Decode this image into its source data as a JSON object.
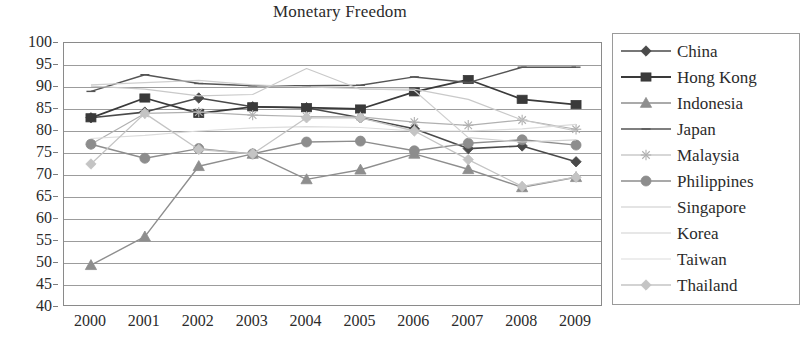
{
  "chart_data": {
    "type": "line",
    "title": "Monetary Freedom",
    "xlabel": "",
    "ylabel": "",
    "grid": true,
    "legend_position": "right",
    "ylim": [
      40,
      100
    ],
    "ytick_step": 5,
    "yticks": [
      100,
      95,
      90,
      85,
      80,
      75,
      70,
      65,
      60,
      55,
      50,
      45,
      40
    ],
    "categories": [
      "2000",
      "2001",
      "2002",
      "2003",
      "2004",
      "2005",
      "2006",
      "2007",
      "2008",
      "2009"
    ],
    "x": [
      2000,
      2001,
      2002,
      2003,
      2004,
      2005,
      2006,
      2007,
      2008,
      2009
    ],
    "series": [
      {
        "name": "China",
        "marker": "diamond",
        "color": "#4a4a4a",
        "line_width": 1.6,
        "values": [
          83.0,
          84.3,
          87.5,
          85.5,
          85.3,
          83.0,
          80.5,
          76.0,
          76.6,
          73.0
        ]
      },
      {
        "name": "Hong Kong",
        "marker": "square",
        "color": "#3a3a3a",
        "line_width": 1.8,
        "values": [
          83.0,
          87.5,
          84.0,
          85.5,
          85.3,
          85.0,
          88.9,
          91.7,
          87.2,
          86.0
        ]
      },
      {
        "name": "Indonesia",
        "marker": "triangle",
        "color": "#8e8e8e",
        "line_width": 1.4,
        "values": [
          49.5,
          56.0,
          72.0,
          74.8,
          69.0,
          71.2,
          74.8,
          71.3,
          67.2,
          69.5
        ]
      },
      {
        "name": "Japan",
        "marker": "line",
        "color": "#555555",
        "line_width": 1.5,
        "values": [
          89.0,
          92.8,
          90.8,
          90.3,
          90.3,
          90.4,
          92.3,
          91.0,
          94.5,
          94.5
        ]
      },
      {
        "name": "Malaysia",
        "marker": "star",
        "color": "#b0b0b0",
        "line_width": 1.2,
        "values": [
          77.0,
          84.0,
          84.3,
          83.6,
          83.3,
          83.2,
          82.0,
          81.3,
          82.5,
          80.4
        ]
      },
      {
        "name": "Philippines",
        "marker": "circle",
        "color": "#8d8d8d",
        "line_width": 1.4,
        "values": [
          77.0,
          73.8,
          76.0,
          74.8,
          77.5,
          77.7,
          75.5,
          77.2,
          78.0,
          76.8
        ]
      },
      {
        "name": "Singapore",
        "marker": "none",
        "color": "#c9c9c9",
        "line_width": 1.2,
        "values": [
          90.2,
          89.5,
          88.0,
          88.3,
          94.2,
          89.5,
          89.5,
          87.2,
          82.5,
          80.0
        ]
      },
      {
        "name": "Korea",
        "marker": "none",
        "color": "#cfcfcf",
        "line_width": 1.2,
        "values": [
          90.5,
          91.0,
          91.5,
          90.5,
          90.0,
          89.6,
          89.2,
          78.5,
          77.5,
          78.0
        ]
      },
      {
        "name": "Taiwan",
        "marker": "none",
        "color": "#dcdcdc",
        "line_width": 1.2,
        "values": [
          78.3,
          79.0,
          80.0,
          80.7,
          81.0,
          80.8,
          80.0,
          80.0,
          80.5,
          81.5
        ]
      },
      {
        "name": "Thailand",
        "marker": "diamond",
        "color": "#c4c4c4",
        "line_width": 1.3,
        "values": [
          72.5,
          84.0,
          75.8,
          74.8,
          83.0,
          83.0,
          80.0,
          73.5,
          67.4,
          69.5
        ]
      }
    ]
  },
  "legend": {
    "items": [
      {
        "label": "China"
      },
      {
        "label": "Hong Kong"
      },
      {
        "label": "Indonesia"
      },
      {
        "label": "Japan"
      },
      {
        "label": "Malaysia"
      },
      {
        "label": "Philippines"
      },
      {
        "label": "Singapore"
      },
      {
        "label": "Korea"
      },
      {
        "label": "Taiwan"
      },
      {
        "label": "Thailand"
      }
    ]
  }
}
